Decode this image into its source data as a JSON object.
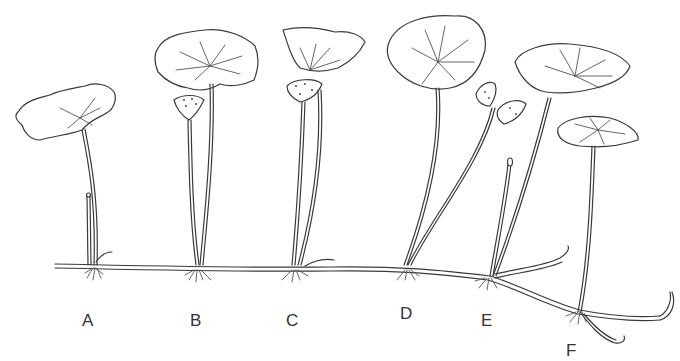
{
  "figure": {
    "labels": [
      {
        "id": "A",
        "text": "A",
        "x": 82,
        "y": 312
      },
      {
        "id": "B",
        "text": "B",
        "x": 190,
        "y": 312
      },
      {
        "id": "C",
        "text": "C",
        "x": 286,
        "y": 312
      },
      {
        "id": "D",
        "text": "D",
        "x": 400,
        "y": 305
      },
      {
        "id": "E",
        "text": "E",
        "x": 481,
        "y": 312
      },
      {
        "id": "F",
        "text": "F",
        "x": 566,
        "y": 342
      }
    ],
    "colors": {
      "line": "#3a3a3a",
      "background": "#ffffff"
    }
  }
}
